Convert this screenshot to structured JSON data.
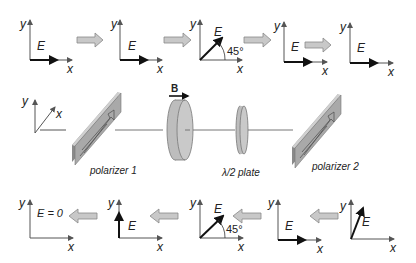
{
  "diagram": {
    "axis_labels": {
      "x": "x",
      "y": "y"
    },
    "field_label": "E",
    "magnetic_field_label": "B",
    "components": [
      {
        "id": "polarizer-1",
        "label": "polarizer 1"
      },
      {
        "id": "faraday-rotator",
        "label": ""
      },
      {
        "id": "half-wave-plate",
        "label": "λ/2 plate"
      },
      {
        "id": "polarizer-2",
        "label": "polarizer 2"
      }
    ],
    "top_row": {
      "direction": "right",
      "states": [
        {
          "label": "E",
          "orientation": "horizontal"
        },
        {
          "label": "E",
          "orientation": "horizontal"
        },
        {
          "label": "E",
          "orientation": "45°",
          "angle_label": "45°"
        },
        {
          "label": "E",
          "orientation": "horizontal"
        },
        {
          "label": "E",
          "orientation": "horizontal"
        }
      ]
    },
    "bottom_row": {
      "direction": "left",
      "states": [
        {
          "label": "E = 0",
          "orientation": "none"
        },
        {
          "label": "E",
          "orientation": "vertical"
        },
        {
          "label": "E",
          "orientation": "45°",
          "angle_label": "45°"
        },
        {
          "label": "E",
          "orientation": "horizontal"
        },
        {
          "label": "E",
          "orientation": "steep-diagonal"
        }
      ]
    },
    "coordinate_frame": {
      "x": "x",
      "y": "y"
    },
    "colors": {
      "arrow_fill": "#c8c8c8",
      "component_fill": "#b9b9b9",
      "polarizer_fill": "#a6a6a6",
      "axis": "#555555",
      "vector": "#111111"
    }
  }
}
